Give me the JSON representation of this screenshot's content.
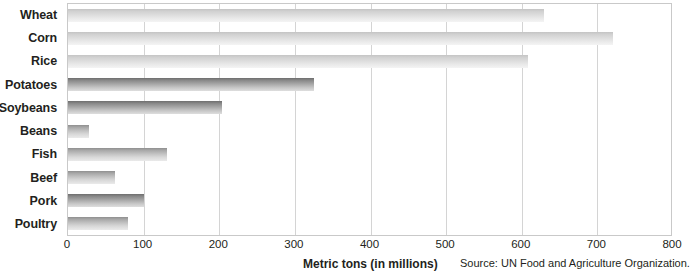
{
  "chart_data": {
    "type": "bar",
    "orientation": "horizontal",
    "title": "",
    "xlabel": "Metric tons (in millions)",
    "ylabel": "",
    "xlim": [
      0,
      800
    ],
    "xticks": [
      0,
      100,
      200,
      300,
      400,
      500,
      600,
      700,
      800
    ],
    "grid": true,
    "legend": false,
    "categories": [
      "Wheat",
      "Corn",
      "Rice",
      "Potatoes",
      "Soybeans",
      "Beans",
      "Fish",
      "Beef",
      "Pork",
      "Poultry"
    ],
    "values": [
      630,
      720,
      608,
      325,
      203,
      28,
      131,
      62,
      101,
      79
    ],
    "bars": [
      {
        "label": "Wheat",
        "value": 630,
        "shade": "light"
      },
      {
        "label": "Corn",
        "value": 720,
        "shade": "light"
      },
      {
        "label": "Rice",
        "value": 608,
        "shade": "light"
      },
      {
        "label": "Potatoes",
        "value": 325,
        "shade": "dark"
      },
      {
        "label": "Soybeans",
        "value": 203,
        "shade": "dark"
      },
      {
        "label": "Beans",
        "value": 28,
        "shade": "mid"
      },
      {
        "label": "Fish",
        "value": 131,
        "shade": "mid"
      },
      {
        "label": "Beef",
        "value": 62,
        "shade": "mid"
      },
      {
        "label": "Pork",
        "value": 101,
        "shade": "dark"
      },
      {
        "label": "Poultry",
        "value": 79,
        "shade": "mid"
      }
    ],
    "annotations": [
      "Source: UN Food and Agriculture Organization."
    ],
    "colors": {
      "bar_light": "#d2d2d2",
      "bar_mid": "#a8a8a8",
      "bar_dark": "#8b8b8b",
      "gridline": "#d4d4d4",
      "border": "#c9c9c9",
      "text": "#231f20",
      "background": "#ffffff"
    }
  },
  "footer": {
    "axis_title": "Metric tons (in millions)",
    "source": "Source: UN Food and Agriculture Organization."
  }
}
